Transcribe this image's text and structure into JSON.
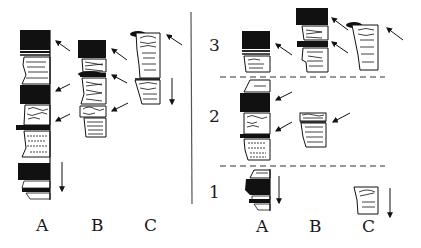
{
  "diagram": {
    "left_panel": {
      "columns": [
        {
          "label": "A"
        },
        {
          "label": "B"
        },
        {
          "label": "C"
        }
      ]
    },
    "right_panel": {
      "columns": [
        {
          "label": "A"
        },
        {
          "label": "B"
        },
        {
          "label": "C"
        }
      ],
      "zones": [
        {
          "label": "3"
        },
        {
          "label": "2"
        },
        {
          "label": "1"
        }
      ]
    },
    "colors": {
      "ink": "#111111",
      "background": "#ffffff",
      "divider": "#555555",
      "dashed_line": "#333333"
    }
  }
}
